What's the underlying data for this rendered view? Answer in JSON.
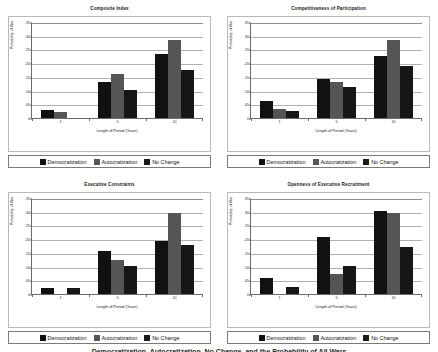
{
  "figure": {
    "caption": "Democratization, Autocratization, No Change, and the Probability of All Wars",
    "ylabel": "Probability of War",
    "xlabel": "Length of Period (Years)",
    "ytick_labels": [
      ".35",
      ".30",
      ".25",
      ".20",
      ".15",
      ".10",
      ".05",
      "0"
    ],
    "ytick_values": [
      0.35,
      0.3,
      0.25,
      0.2,
      0.15,
      0.1,
      0.05,
      0
    ],
    "xtick_labels": [
      "1",
      "5",
      "10"
    ],
    "legend": [
      {
        "label": "Democratization",
        "color": "#111111",
        "icon": "legend-swatch-icon"
      },
      {
        "label": "Autocratization",
        "color": "#565656",
        "icon": "legend-swatch-icon"
      },
      {
        "label": "No Change",
        "color": "#1a1a1a",
        "icon": "legend-swatch-icon"
      }
    ]
  },
  "chart_data": [
    {
      "type": "bar",
      "title": "Composite Index",
      "xlabel": "Length of Period (Years)",
      "ylabel": "Probability of War",
      "categories": [
        "1",
        "5",
        "10"
      ],
      "ylim": [
        0,
        0.35
      ],
      "grid": true,
      "legend_position": "bottom",
      "series": [
        {
          "name": "Democratization",
          "values": [
            0.03,
            0.132,
            0.232
          ]
        },
        {
          "name": "Autocratization",
          "values": [
            0.022,
            0.161,
            0.285
          ]
        },
        {
          "name": "No Change",
          "values": [
            0.0,
            0.102,
            0.175
          ]
        }
      ]
    },
    {
      "type": "bar",
      "title": "Competitiveness of Participation",
      "xlabel": "Length of Period (Years)",
      "ylabel": "Probability of War",
      "categories": [
        "1",
        "5",
        "10"
      ],
      "ylim": [
        0,
        0.35
      ],
      "grid": true,
      "legend_position": "bottom",
      "series": [
        {
          "name": "Democratization",
          "values": [
            0.062,
            0.143,
            0.226
          ]
        },
        {
          "name": "Autocratization",
          "values": [
            0.034,
            0.132,
            0.283
          ]
        },
        {
          "name": "No Change",
          "values": [
            0.025,
            0.112,
            0.188
          ]
        }
      ]
    },
    {
      "type": "bar",
      "title": "Executive Constraints",
      "xlabel": "Length of Period (Years)",
      "ylabel": "Probability of War",
      "categories": [
        "1",
        "5",
        "10"
      ],
      "ylim": [
        0,
        0.35
      ],
      "grid": true,
      "legend_position": "bottom",
      "series": [
        {
          "name": "Democratization",
          "values": [
            0.023,
            0.157,
            0.195
          ]
        },
        {
          "name": "Autocratization",
          "values": [
            0.0,
            0.123,
            0.297
          ]
        },
        {
          "name": "No Change",
          "values": [
            0.023,
            0.101,
            0.177
          ]
        }
      ]
    },
    {
      "type": "bar",
      "title": "Openness of Executive Recruitment",
      "xlabel": "Length of Period (Years)",
      "ylabel": "Probability of War",
      "categories": [
        "1",
        "5",
        "10"
      ],
      "ylim": [
        0,
        0.35
      ],
      "grid": true,
      "legend_position": "bottom",
      "series": [
        {
          "name": "Democratization",
          "values": [
            0.06,
            0.207,
            0.303
          ]
        },
        {
          "name": "Autocratization",
          "values": [
            0.0,
            0.074,
            0.297
          ]
        },
        {
          "name": "No Change",
          "values": [
            0.025,
            0.102,
            0.173
          ]
        }
      ]
    }
  ]
}
